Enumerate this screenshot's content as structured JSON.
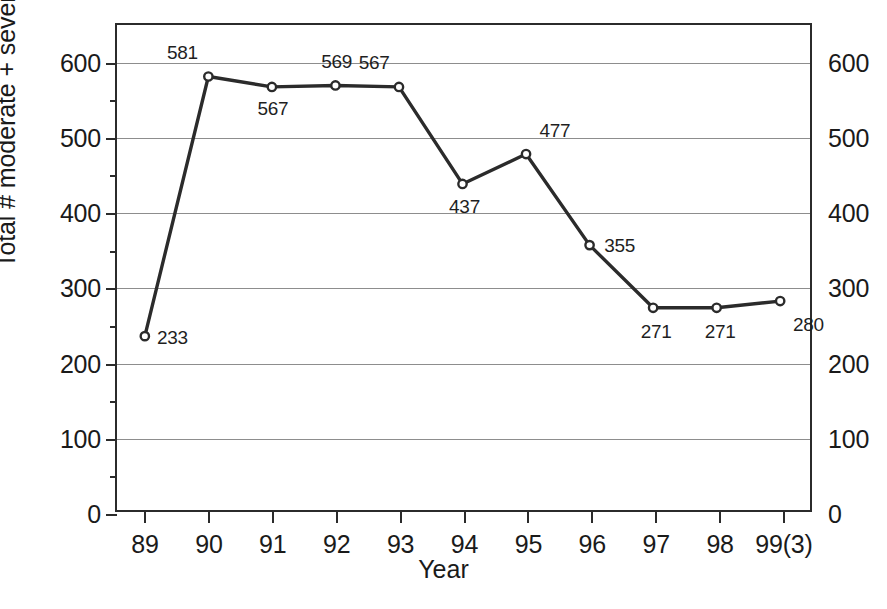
{
  "chart_data": {
    "type": "line",
    "title": "",
    "xlabel": "Year",
    "ylabel": "Total # moderate + severe ADEs",
    "categories": [
      "89",
      "90",
      "91",
      "92",
      "93",
      "94",
      "95",
      "96",
      "97",
      "98",
      "99(3)"
    ],
    "values": [
      233,
      581,
      567,
      569,
      567,
      437,
      477,
      355,
      271,
      271,
      280
    ],
    "point_labels": [
      "233",
      "581",
      "567",
      "569",
      "567",
      "437",
      "477",
      "355",
      "271",
      "271",
      "280"
    ],
    "label_positions": [
      "right",
      "above-left",
      "below",
      "above",
      "above-left",
      "below",
      "above-right",
      "right",
      "below",
      "below",
      "below-right"
    ],
    "ylim": [
      0,
      650
    ],
    "xlim": [
      0,
      10
    ],
    "y_major_ticks": [
      0,
      100,
      200,
      300,
      400,
      500,
      600
    ],
    "y_minor_ticks": [
      50,
      150,
      250,
      350,
      450,
      550
    ],
    "y_tick_labels_left": [
      "0",
      "100",
      "200",
      "300",
      "400",
      "500",
      "600"
    ],
    "y_tick_labels_right": [
      "0",
      "100",
      "200",
      "300",
      "400",
      "500",
      "600"
    ],
    "grid": true,
    "grid_axis": "y",
    "legend": false,
    "series_color": "#2b2b2b",
    "grid_color": "#8d8d8d",
    "frame_color": "#2b2b2b",
    "marker": "open-circle"
  }
}
